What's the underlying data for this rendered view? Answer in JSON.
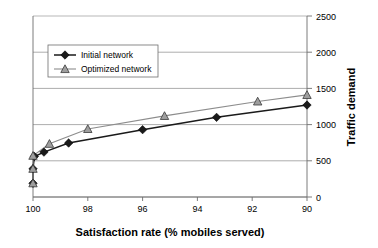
{
  "chart_data": {
    "type": "line",
    "title": "",
    "xlabel": "Satisfaction rate (% mobiles served)",
    "ylabel": "Traffic demand",
    "xlim": [
      100,
      90
    ],
    "ylim": [
      0,
      2500
    ],
    "x_ticks": [
      100,
      98,
      96,
      94,
      92,
      90
    ],
    "y_ticks": [
      0,
      500,
      1000,
      1500,
      2000,
      2500
    ],
    "x_axis_reversed": true,
    "grid": "horizontal",
    "legend_position": "upper-left-inside",
    "series": [
      {
        "name": "Initial network",
        "marker": "diamond",
        "color": "#1a1a1a",
        "points": [
          {
            "x": 100.0,
            "y": 190
          },
          {
            "x": 100.0,
            "y": 390
          },
          {
            "x": 99.95,
            "y": 560
          },
          {
            "x": 99.6,
            "y": 620
          },
          {
            "x": 98.7,
            "y": 745
          },
          {
            "x": 96.0,
            "y": 930
          },
          {
            "x": 93.3,
            "y": 1100
          },
          {
            "x": 90.0,
            "y": 1270
          }
        ]
      },
      {
        "name": "Optimized network",
        "marker": "triangle",
        "color": "#8d8d8d",
        "points": [
          {
            "x": 100.0,
            "y": 190
          },
          {
            "x": 100.0,
            "y": 390
          },
          {
            "x": 100.0,
            "y": 570
          },
          {
            "x": 99.4,
            "y": 735
          },
          {
            "x": 98.0,
            "y": 940
          },
          {
            "x": 95.2,
            "y": 1120
          },
          {
            "x": 91.8,
            "y": 1320
          },
          {
            "x": 90.0,
            "y": 1410
          }
        ]
      }
    ]
  },
  "legend": {
    "items": [
      {
        "label": "Initial network"
      },
      {
        "label": "Optimized network"
      }
    ]
  },
  "axes": {
    "x_tick_labels": [
      "100",
      "98",
      "96",
      "94",
      "92",
      "90"
    ],
    "y_tick_labels": [
      "0",
      "500",
      "1000",
      "1500",
      "2000",
      "2500"
    ],
    "x_title": "Satisfaction rate (% mobiles served)",
    "y_title": "Traffic demand"
  },
  "colors": {
    "initial_series": "#1a1a1a",
    "optimized_series": "#8d8d8d",
    "grid": "#8a8a8a",
    "axis": "#6e6e6e",
    "background": "#ffffff"
  }
}
